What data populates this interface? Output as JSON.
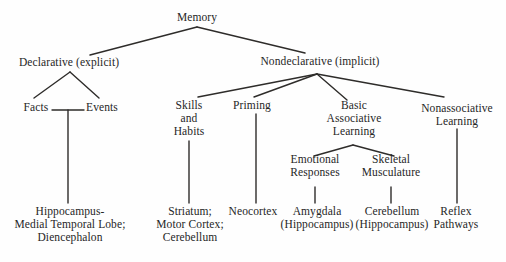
{
  "diagram": {
    "type": "tree",
    "nodes": {
      "memory": {
        "label": "Memory"
      },
      "declarative": {
        "label": "Declarative (explicit)"
      },
      "nondeclarative": {
        "label": "Nondeclarative (implicit)"
      },
      "facts": {
        "label": "Facts"
      },
      "events": {
        "label": "Events"
      },
      "skills": {
        "label": "Skills\nand\nHabits"
      },
      "priming": {
        "label": "Priming"
      },
      "basic": {
        "label": "Basic\nAssociative\nLearning"
      },
      "nonassociative": {
        "label": "Nonassociative\nLearning"
      },
      "emotional": {
        "label": "Emotional\nResponses"
      },
      "skeletal": {
        "label": "Skeletal\nMusculature"
      },
      "hippocampus": {
        "label": "Hippocampus-\nMedial Temporal Lobe;\nDiencephalon"
      },
      "striatum": {
        "label": "Striatum;\nMotor Cortex;\nCerebellum"
      },
      "neocortex": {
        "label": "Neocortex"
      },
      "amygdala": {
        "label": "Amygdala\n(Hippocampus)"
      },
      "cerebellum": {
        "label": "Cerebellum\n(Hippocampus)"
      },
      "reflex": {
        "label": "Reflex\nPathways"
      }
    },
    "edges": [
      {
        "from": "memory",
        "to": "declarative"
      },
      {
        "from": "memory",
        "to": "nondeclarative"
      },
      {
        "from": "declarative",
        "to": "facts"
      },
      {
        "from": "declarative",
        "to": "events"
      },
      {
        "from": "facts+events",
        "to": "hippocampus"
      },
      {
        "from": "nondeclarative",
        "to": "skills"
      },
      {
        "from": "nondeclarative",
        "to": "priming"
      },
      {
        "from": "nondeclarative",
        "to": "basic"
      },
      {
        "from": "nondeclarative",
        "to": "nonassociative"
      },
      {
        "from": "skills",
        "to": "striatum"
      },
      {
        "from": "priming",
        "to": "neocortex"
      },
      {
        "from": "basic",
        "to": "emotional"
      },
      {
        "from": "basic",
        "to": "skeletal"
      },
      {
        "from": "emotional",
        "to": "amygdala"
      },
      {
        "from": "skeletal",
        "to": "cerebellum"
      },
      {
        "from": "nonassociative",
        "to": "reflex"
      }
    ],
    "colors": {
      "line": "#2e2c2a",
      "text": "#262626",
      "background": "#fefefe"
    }
  }
}
